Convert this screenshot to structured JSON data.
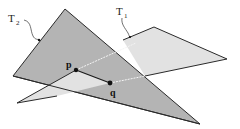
{
  "diagram": {
    "colors": {
      "background": "#ffffff",
      "t2_fill": "#b4b4b4",
      "t1_fill": "#e2e2e2",
      "edge": "#2a2a2a",
      "intersection_line": "#f4f4f4",
      "point": "#111111"
    },
    "triangles": [
      {
        "id": "T1",
        "label": "T",
        "subscript": "1",
        "vertices": [
          [
            154,
            27
          ],
          [
            227,
            59
          ],
          [
            17,
            103
          ]
        ]
      },
      {
        "id": "T2",
        "label": "T",
        "subscript": "2",
        "vertices": [
          [
            65,
            9
          ],
          [
            13,
            76
          ],
          [
            200,
            124
          ]
        ]
      }
    ],
    "labels": {
      "t1_main": "T",
      "t1_sub": "1",
      "t2_main": "T",
      "t2_sub": "2",
      "p": "p",
      "q": "q"
    },
    "points": {
      "p": [
        76,
        70
      ],
      "q": [
        110,
        83
      ]
    }
  }
}
